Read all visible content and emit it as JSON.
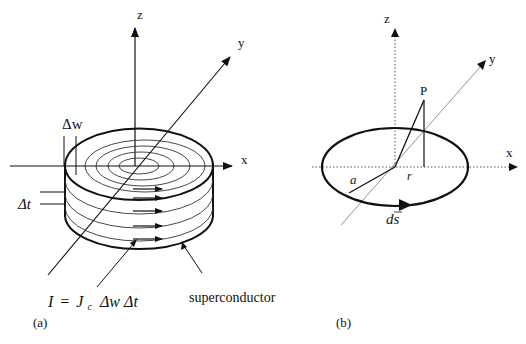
{
  "panel_a": {
    "caption": "(a)",
    "axes": {
      "x": "x",
      "y": "y",
      "z": "z"
    },
    "labels": {
      "delta_w": "Δw",
      "delta_t": "Δt",
      "formula_I": "I",
      "formula_eq": "=",
      "formula_J": "J",
      "formula_c": "c",
      "formula_rest": "Δw Δt",
      "superconductor": "superconductor"
    }
  },
  "panel_b": {
    "caption": "(b)",
    "axes": {
      "x": "x",
      "y": "y",
      "z": "z"
    },
    "labels": {
      "point": "P",
      "radius_r": "r",
      "radius_a": "a",
      "ds": "ds"
    }
  },
  "colors": {
    "ink": "#111111",
    "dotted": "#555555",
    "thin": "#444444"
  }
}
